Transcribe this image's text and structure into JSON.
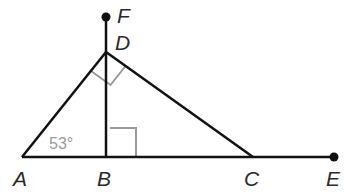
{
  "diagram": {
    "type": "geometry",
    "points": {
      "A": {
        "label": "A",
        "x": 22,
        "y": 157
      },
      "B": {
        "label": "B",
        "x": 106,
        "y": 157
      },
      "C": {
        "label": "C",
        "x": 253,
        "y": 157
      },
      "D": {
        "label": "D",
        "x": 106,
        "y": 52
      },
      "E": {
        "label": "E",
        "x": 334,
        "y": 157
      },
      "F": {
        "label": "F",
        "x": 106,
        "y": 17
      }
    },
    "segments": [
      "AD",
      "DC",
      "AE",
      "BF"
    ],
    "endpoints_dotted": [
      "E",
      "F"
    ],
    "angle_labels": [
      {
        "at": "A",
        "text": "53°"
      }
    ],
    "right_angles": [
      "DBC",
      "ADC"
    ],
    "colors": {
      "line": "#111111",
      "marker": "#999999",
      "label": "#2a2a2a",
      "angle_text": "#9a9a9a"
    }
  }
}
